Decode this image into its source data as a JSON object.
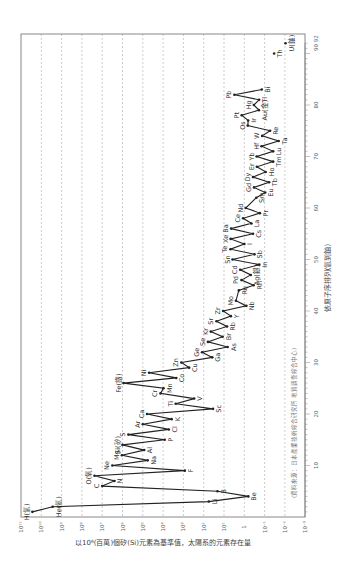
{
  "chart_data": {
    "type": "line",
    "orientation": "rotated-90-ccw",
    "title": "",
    "xlabel": "依原子序排列(氫到鈾)",
    "ylabel": "以10⁶(百萬)個矽(Si)元素為基準值，太陽系的元素存在量",
    "source_note": "(資料來源：日本產業技術綜合研究所 地質調查綜合中心)",
    "x_ticks": [
      "10",
      "20",
      "30",
      "40",
      "50",
      "60",
      "70",
      "80",
      "90",
      "92"
    ],
    "x_tick_values": [
      10,
      20,
      30,
      40,
      50,
      60,
      70,
      80,
      90,
      92
    ],
    "y_ticks": [
      "10¹¹",
      "10¹⁰",
      "10⁹",
      "10⁸",
      "10⁷",
      "10⁶",
      "10⁵",
      "10⁴",
      "10³",
      "10²",
      "10¹",
      "1",
      "10⁻¹",
      "10⁻²",
      "10⁻³"
    ],
    "y_tick_exponents": [
      11,
      10,
      9,
      8,
      7,
      6,
      5,
      4,
      3,
      2,
      1,
      0,
      -1,
      -2,
      -3
    ],
    "ylim": [
      0.001,
      100000000000
    ],
    "yscale": "log",
    "xlim": [
      0,
      92
    ],
    "grid": true,
    "series": [
      {
        "name": "solar-system-abundance",
        "points": [
          {
            "z": 1,
            "el": "H(氫)",
            "log": 10.44
          },
          {
            "z": 2,
            "el": "He(氦)",
            "log": 9.44
          },
          {
            "z": 3,
            "el": "Li",
            "log": 1.75
          },
          {
            "z": 4,
            "el": "Be",
            "log": -0.2
          },
          {
            "z": 5,
            "el": "B",
            "log": 1.32
          },
          {
            "z": 6,
            "el": "C",
            "log": 7.0
          },
          {
            "z": 7,
            "el": "N",
            "log": 6.4
          },
          {
            "z": 8,
            "el": "O(氧)",
            "log": 7.38
          },
          {
            "z": 9,
            "el": "F",
            "log": 2.93
          },
          {
            "z": 10,
            "el": "Ne",
            "log": 6.5
          },
          {
            "z": 11,
            "el": "Na",
            "log": 4.76
          },
          {
            "z": 12,
            "el": "Mg",
            "log": 6.03
          },
          {
            "z": 13,
            "el": "Al",
            "log": 4.93
          },
          {
            "z": 14,
            "el": "Si(矽)",
            "log": 6.0
          },
          {
            "z": 15,
            "el": "P",
            "log": 3.92
          },
          {
            "z": 16,
            "el": "S",
            "log": 5.71
          },
          {
            "z": 17,
            "el": "Cl",
            "log": 3.72
          },
          {
            "z": 18,
            "el": "Ar",
            "log": 5.0
          },
          {
            "z": 19,
            "el": "K",
            "log": 3.58
          },
          {
            "z": 20,
            "el": "Ca",
            "log": 4.79
          },
          {
            "z": 21,
            "el": "Sc",
            "log": 1.54
          },
          {
            "z": 22,
            "el": "Ti",
            "log": 3.38
          },
          {
            "z": 23,
            "el": "V",
            "log": 2.47
          },
          {
            "z": 24,
            "el": "Cr",
            "log": 4.13
          },
          {
            "z": 25,
            "el": "Mn",
            "log": 3.98
          },
          {
            "z": 26,
            "el": "Fe(鐵)",
            "log": 5.95
          },
          {
            "z": 27,
            "el": "Co",
            "log": 3.35
          },
          {
            "z": 28,
            "el": "Ni",
            "log": 4.69
          },
          {
            "z": 29,
            "el": "Cu",
            "log": 2.72
          },
          {
            "z": 30,
            "el": "Zn",
            "log": 3.1
          },
          {
            "z": 31,
            "el": "Ga",
            "log": 1.58
          },
          {
            "z": 32,
            "el": "Ge",
            "log": 2.08
          },
          {
            "z": 33,
            "el": "As",
            "log": 0.82
          },
          {
            "z": 34,
            "el": "Se",
            "log": 1.79
          },
          {
            "z": 35,
            "el": "Br",
            "log": 1.07
          },
          {
            "z": 36,
            "el": "Kr",
            "log": 1.65
          },
          {
            "z": 37,
            "el": "Rb",
            "log": 0.85
          },
          {
            "z": 38,
            "el": "Sr",
            "log": 1.37
          },
          {
            "z": 39,
            "el": "Y",
            "log": 0.66
          },
          {
            "z": 40,
            "el": "Zr",
            "log": 1.04
          },
          {
            "z": 41,
            "el": "Nb",
            "log": -0.1
          },
          {
            "z": 42,
            "el": "Mo",
            "log": 0.41
          },
          {
            "z": 44,
            "el": "Ru",
            "log": 0.27
          },
          {
            "z": 45,
            "el": "Rh",
            "log": -0.46
          },
          {
            "z": 46,
            "el": "Pd",
            "log": 0.14
          },
          {
            "z": 47,
            "el": "Ag(銀)",
            "log": -0.32
          },
          {
            "z": 48,
            "el": "Cd",
            "log": 0.2
          },
          {
            "z": 49,
            "el": "In",
            "log": -0.74
          },
          {
            "z": 50,
            "el": "Sn",
            "log": 0.58
          },
          {
            "z": 51,
            "el": "Sb",
            "log": -0.5
          },
          {
            "z": 52,
            "el": "Te",
            "log": 0.68
          },
          {
            "z": 53,
            "el": "I",
            "log": 0.0
          },
          {
            "z": 54,
            "el": "Xe",
            "log": 0.67
          },
          {
            "z": 55,
            "el": "Cs",
            "log": -0.43
          },
          {
            "z": 56,
            "el": "Ba",
            "log": 0.65
          },
          {
            "z": 57,
            "el": "La",
            "log": -0.35
          },
          {
            "z": 58,
            "el": "Ce",
            "log": 0.06
          },
          {
            "z": 59,
            "el": "Pr",
            "log": -0.77
          },
          {
            "z": 60,
            "el": "Nd",
            "log": -0.07
          },
          {
            "z": 62,
            "el": "Sm",
            "log": -0.59
          },
          {
            "z": 63,
            "el": "Eu",
            "log": -1.03
          },
          {
            "z": 64,
            "el": "Gd",
            "log": -0.48
          },
          {
            "z": 65,
            "el": "Tb",
            "log": -1.22
          },
          {
            "z": 66,
            "el": "Dy",
            "log": -0.43
          },
          {
            "z": 67,
            "el": "Ho",
            "log": -1.05
          },
          {
            "z": 68,
            "el": "Er",
            "log": -0.62
          },
          {
            "z": 69,
            "el": "Tm",
            "log": -1.42
          },
          {
            "z": 70,
            "el": "Yb",
            "log": -0.61
          },
          {
            "z": 71,
            "el": "Lu",
            "log": -1.42
          },
          {
            "z": 72,
            "el": "Hf",
            "log": -0.85
          },
          {
            "z": 73,
            "el": "Ta",
            "log": -1.69
          },
          {
            "z": 74,
            "el": "W",
            "log": -0.88
          },
          {
            "z": 75,
            "el": "Re",
            "log": -1.27
          },
          {
            "z": 76,
            "el": "Os",
            "log": -0.17
          },
          {
            "z": 77,
            "el": "Ir",
            "log": -0.19
          },
          {
            "z": 78,
            "el": "Pt",
            "log": 0.13
          },
          {
            "z": 79,
            "el": "Au(金)",
            "log": -0.72
          },
          {
            "z": 80,
            "el": "Hg",
            "log": -0.47
          },
          {
            "z": 81,
            "el": "Tl",
            "log": -0.73
          },
          {
            "z": 82,
            "el": "Pb",
            "log": 0.49
          },
          {
            "z": 83,
            "el": "Bi",
            "log": -0.86
          }
        ]
      },
      {
        "name": "isolated",
        "points": [
          {
            "z": 90,
            "el": "Th",
            "log": -1.47
          },
          {
            "z": 92,
            "el": "U(鈾)",
            "log": -2.03
          }
        ]
      }
    ]
  },
  "colors": {
    "line": "#222222",
    "frame": "#888888",
    "grid": "#aaaaaa",
    "text": "#333333"
  }
}
